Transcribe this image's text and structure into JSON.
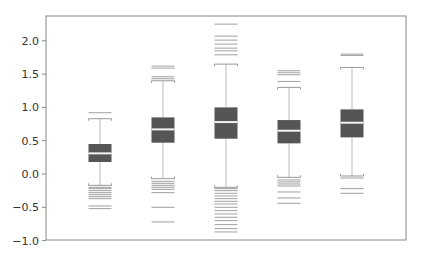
{
  "chart_data": {
    "type": "box",
    "title": "",
    "xlabel": "",
    "ylabel": "",
    "ylim": [
      -1.0,
      2.37
    ],
    "yticks": [
      -1.0,
      -0.5,
      0.0,
      0.5,
      1.0,
      1.5,
      2.0
    ],
    "ytick_labels": [
      "−1.0",
      "−0.5",
      "0.0",
      "0.5",
      "1.0",
      "1.5",
      "2.0"
    ],
    "xticks_shown": false,
    "grid": false,
    "legend": null,
    "colors": {
      "box_fill": "#555555",
      "median": "#f2f2f2",
      "whisker": "#bbbbbb",
      "cap": "#999999",
      "flier": "#888888",
      "axis": "#888888"
    },
    "series": [
      {
        "name": "box1",
        "q1": 0.18,
        "median": 0.31,
        "q3": 0.45,
        "whisker_low": -0.17,
        "whisker_high": 0.83,
        "fliers": [
          0.92,
          -0.2,
          -0.22,
          -0.25,
          -0.28,
          -0.31,
          -0.34,
          -0.37,
          -0.48,
          -0.52
        ]
      },
      {
        "name": "box2",
        "q1": 0.47,
        "median": 0.67,
        "q3": 0.85,
        "whisker_low": -0.07,
        "whisker_high": 1.4,
        "fliers": [
          1.62,
          1.59,
          1.46,
          1.43,
          -0.11,
          -0.14,
          -0.17,
          -0.2,
          -0.23,
          -0.28,
          -0.5,
          -0.72
        ]
      },
      {
        "name": "box3",
        "q1": 0.53,
        "median": 0.78,
        "q3": 1.0,
        "whisker_low": -0.2,
        "whisker_high": 1.65,
        "fliers": [
          2.25,
          2.07,
          2.01,
          1.95,
          1.89,
          1.85,
          1.79,
          -0.22,
          -0.25,
          -0.29,
          -0.33,
          -0.37,
          -0.41,
          -0.45,
          -0.5,
          -0.55,
          -0.6,
          -0.65,
          -0.7,
          -0.76,
          -0.82,
          -0.87
        ]
      },
      {
        "name": "box4",
        "q1": 0.46,
        "median": 0.65,
        "q3": 0.81,
        "whisker_low": -0.05,
        "whisker_high": 1.3,
        "fliers": [
          1.55,
          1.52,
          1.49,
          1.39,
          -0.09,
          -0.12,
          -0.15,
          -0.18,
          -0.27,
          -0.36,
          -0.44
        ]
      },
      {
        "name": "box5",
        "q1": 0.55,
        "median": 0.77,
        "q3": 0.97,
        "whisker_low": -0.03,
        "whisker_high": 1.6,
        "fliers": [
          1.8,
          1.78,
          -0.06,
          -0.22,
          -0.29
        ]
      }
    ]
  }
}
